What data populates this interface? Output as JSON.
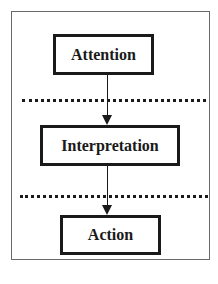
{
  "diagram": {
    "type": "flowchart",
    "direction": "top-to-bottom",
    "stages": [
      {
        "label": "Attention"
      },
      {
        "label": "Interpretation"
      },
      {
        "label": "Action"
      }
    ],
    "separators": [
      "dotted",
      "dotted"
    ],
    "edges": [
      {
        "from": "Attention",
        "to": "Interpretation"
      },
      {
        "from": "Interpretation",
        "to": "Action"
      }
    ],
    "colors": {
      "stroke": "#1a1a1a",
      "frame": "#6a6a6a",
      "background": "#ffffff"
    }
  }
}
